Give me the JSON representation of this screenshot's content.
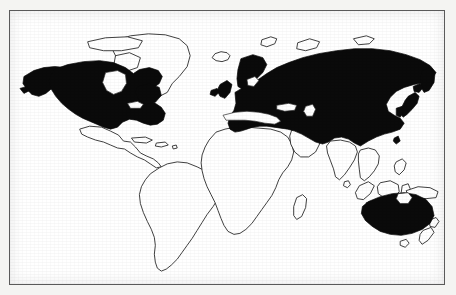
{
  "figure": {
    "type": "thematic-world-map",
    "title": "",
    "caption": "",
    "projection": "equirectangular-like",
    "background_color": "#ffffff",
    "page_color": "#f4f4f2",
    "frame": {
      "visible": true,
      "color": "#5a5a5a",
      "line_width_px": 1
    }
  },
  "legend": {
    "visible": false,
    "entries": [
      {
        "label": "Highlighted region",
        "swatch_color": "#0a0a0a",
        "style": "solid-fill"
      },
      {
        "label": "Other region",
        "swatch_color": "#ffffff",
        "style": "outline-only"
      }
    ]
  },
  "map_data": {
    "fill_color": "#0a0a0a",
    "outline_color": "#2b2b2b",
    "highlighted_regions": [
      "United States",
      "Canada",
      "Alaska",
      "Europe",
      "Scandinavia",
      "United Kingdom",
      "Ireland",
      "Russia",
      "Siberia",
      "Kamchatka",
      "Turkey",
      "China",
      "Mongolia",
      "Japan",
      "Korea",
      "Australia"
    ],
    "unhighlighted_regions": [
      "Greenland",
      "Iceland",
      "Mexico",
      "Central America",
      "Caribbean",
      "South America",
      "Africa",
      "Madagascar",
      "Arabian Peninsula",
      "India",
      "Southeast Asia",
      "Indonesia",
      "Philippines",
      "New Guinea",
      "New Zealand",
      "Tasmania",
      "Sri Lanka"
    ]
  }
}
